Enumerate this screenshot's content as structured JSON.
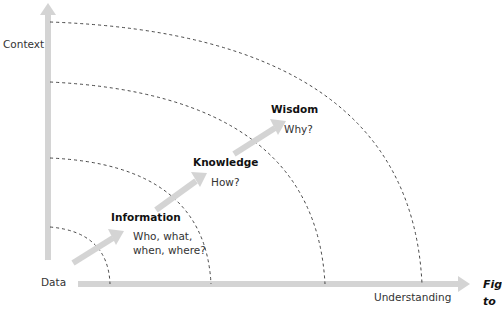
{
  "axes": {
    "y_label": "Context",
    "x_label": "Understanding",
    "origin_label": "Data"
  },
  "stages": [
    {
      "name": "Information",
      "question_lines": [
        "Who, what,",
        "when, where?"
      ]
    },
    {
      "name": "Knowledge",
      "question_lines": [
        "How?"
      ]
    },
    {
      "name": "Wisdom",
      "question_lines": [
        "Why?"
      ]
    }
  ],
  "caption": {
    "lines": [
      "Fig",
      "to"
    ]
  },
  "colors": {
    "axis": "#d4d4d4",
    "arrow": "#d4d4d4",
    "arc": "#333333"
  }
}
